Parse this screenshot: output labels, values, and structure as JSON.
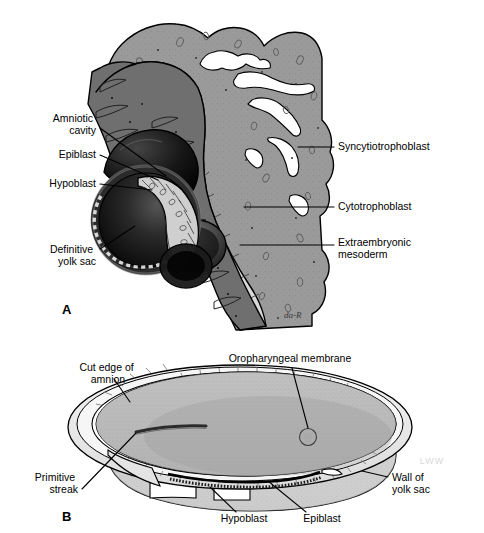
{
  "figure": {
    "background_color": "#ffffff",
    "width": 484,
    "height": 533
  },
  "palette": {
    "syncytiotrophoblast": "#9a9a9a",
    "syncytiotrophoblast_lacuna": "#ffffff",
    "cytotrophoblast": "#d9d9d9",
    "extraembryonic_mesoderm": "#6f6f6f",
    "yolk_sac_cavity": "#121212",
    "amniotic_cavity": "#1a1a1a",
    "disc_epiblast": "#c9c9c9",
    "disc_hypoblast": "#e2e2e2",
    "outline": "#000000",
    "panelB_disc": "#b9b9b9",
    "panelB_amnion": "#efefef",
    "panelB_yolksac_wall": "#cfcfcf",
    "label_text": "#000000"
  },
  "panels": [
    {
      "id": "A",
      "panel_label": "A",
      "panel_label_pos": {
        "x": 62,
        "y": 314
      },
      "caption": "Implantation site showing trophoblast layers and bilaminar disc",
      "signature": "da-R",
      "labels": [
        {
          "key": "amniotic_cavity",
          "text_lines": [
            "Amniotic",
            "cavity"
          ],
          "text_anchor": "end",
          "text_x": 96,
          "text_y": 122,
          "line_height": 12,
          "leader": "M100,128 L166,176"
        },
        {
          "key": "epiblast",
          "text_lines": [
            "Epiblast"
          ],
          "text_anchor": "end",
          "text_x": 96,
          "text_y": 158,
          "line_height": 12,
          "leader": "M100,155 L158,180"
        },
        {
          "key": "hypoblast",
          "text_lines": [
            "Hypoblast"
          ],
          "text_anchor": "end",
          "text_x": 96,
          "text_y": 187,
          "line_height": 12,
          "leader": "M100,184 L152,190"
        },
        {
          "key": "definitive_yolk_sac",
          "text_lines": [
            "Definitive",
            "yolk sac"
          ],
          "text_anchor": "end",
          "text_x": 96,
          "text_y": 253,
          "line_height": 12,
          "leader": "M100,249 L135,226"
        },
        {
          "key": "syncytiotrophoblast",
          "text_lines": [
            "Syncytiotrophoblast"
          ],
          "text_anchor": "start",
          "text_x": 338,
          "text_y": 150,
          "line_height": 12,
          "leader": "M298,148 L334,147"
        },
        {
          "key": "cytotrophoblast",
          "text_lines": [
            "Cytotrophoblast"
          ],
          "text_anchor": "start",
          "text_x": 338,
          "text_y": 210,
          "line_height": 12,
          "leader": "M244,208 L334,207"
        },
        {
          "key": "extraembryonic_mesoderm",
          "text_lines": [
            "Extraembryonic",
            "mesoderm"
          ],
          "text_anchor": "start",
          "text_x": 338,
          "text_y": 246,
          "line_height": 12,
          "leader": "M240,246 L334,245"
        }
      ]
    },
    {
      "id": "B",
      "panel_label": "B",
      "panel_label_pos": {
        "x": 62,
        "y": 521
      },
      "caption": "Dorsal view of bilaminar embryonic disc with amnion cut away",
      "watermark": "LWW",
      "labels": [
        {
          "key": "cut_edge_of_amnion",
          "text_lines": [
            "Cut edge of",
            "amnion"
          ],
          "text_anchor": "middle",
          "text_x": 108,
          "text_y": 371,
          "line_height": 12,
          "leader": "M114,379 L128,400"
        },
        {
          "key": "oropharyngeal_membrane",
          "text_lines": [
            "Oropharyngeal membrane"
          ],
          "text_anchor": "middle",
          "text_x": 290,
          "text_y": 362,
          "line_height": 12,
          "leader": "M290,368 L308,434"
        },
        {
          "key": "primitive_streak",
          "text_lines": [
            "Primitive",
            "streak"
          ],
          "text_anchor": "end",
          "text_x": 78,
          "text_y": 481,
          "line_height": 12,
          "leader": "M82,489 L135,434"
        },
        {
          "key": "wall_of_yolk_sac",
          "text_lines": [
            "Wall of",
            "yolk sac"
          ],
          "text_anchor": "start",
          "text_x": 392,
          "text_y": 481,
          "line_height": 12,
          "leader": "M388,478 L364,472"
        },
        {
          "key": "hypoblast",
          "text_lines": [
            "Hypoblast"
          ],
          "text_anchor": "middle",
          "text_x": 244,
          "text_y": 522,
          "line_height": 12,
          "leader": "M236,512 L208,486"
        },
        {
          "key": "epiblast",
          "text_lines": [
            "Epiblast"
          ],
          "text_anchor": "middle",
          "text_x": 322,
          "text_y": 522,
          "line_height": 12,
          "leader": "M308,512 L266,481"
        }
      ]
    }
  ]
}
